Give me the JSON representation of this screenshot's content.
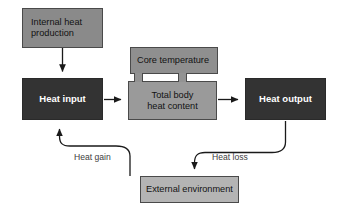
{
  "diagram": {
    "background_color": "#ffffff",
    "nodes": [
      {
        "id": "internal-heat-production",
        "label": "Internal heat\nproduction",
        "fill": "#8a8a8a",
        "text_color": "#121212",
        "bold": false
      },
      {
        "id": "heat-input",
        "label": "Heat input",
        "fill": "#333333",
        "text_color": "#ffffff",
        "bold": true
      },
      {
        "id": "core-temperature",
        "label": "Core temperature",
        "fill": "#8f8f8f",
        "text_color": "#121212",
        "bold": false
      },
      {
        "id": "total-body-heat-content",
        "label": "Total body\nheat content",
        "fill": "#9a9a9a",
        "text_color": "#121212",
        "bold": false
      },
      {
        "id": "heat-output",
        "label": "Heat output",
        "fill": "#333333",
        "text_color": "#ffffff",
        "bold": true
      },
      {
        "id": "external-environment",
        "label": "External environment",
        "fill": "#b4b4b4",
        "text_color": "#121212",
        "bold": false
      }
    ],
    "edges": [
      {
        "id": "internal-heat-to-heat-input",
        "from": "internal-heat-production",
        "to": "heat-input",
        "label": "",
        "style": "straight-arrow",
        "direction": "down"
      },
      {
        "id": "heat-input-to-total-body",
        "from": "heat-input",
        "to": "total-body-heat-content",
        "label": "",
        "style": "straight-arrow",
        "direction": "right"
      },
      {
        "id": "total-body-to-heat-output",
        "from": "total-body-heat-content",
        "to": "heat-output",
        "label": "",
        "style": "straight-arrow",
        "direction": "right"
      },
      {
        "id": "external-env-to-heat-input",
        "from": "external-environment",
        "to": "heat-input",
        "label": "Heat gain",
        "style": "curved-arrow",
        "direction": "up-left"
      },
      {
        "id": "heat-output-to-external-env",
        "from": "heat-output",
        "to": "external-environment",
        "label": "Heat loss",
        "style": "curved-arrow",
        "direction": "down-left"
      }
    ],
    "edge_labels": {
      "heat_gain": "Heat gain",
      "heat_loss": "Heat loss"
    },
    "line_color": "#1a1a1a",
    "border_color": "#4a4a4a"
  }
}
